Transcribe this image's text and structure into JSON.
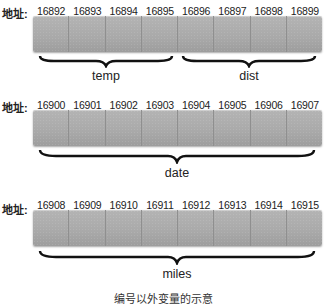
{
  "address_label": "地址:",
  "rows": [
    {
      "addresses": [
        "16892",
        "16893",
        "16894",
        "16895",
        "16896",
        "16897",
        "16898",
        "16899"
      ],
      "variables": [
        {
          "name": "temp",
          "start_cell": 0,
          "end_cell": 3
        },
        {
          "name": "dist",
          "start_cell": 4,
          "end_cell": 7
        }
      ]
    },
    {
      "addresses": [
        "16900",
        "16901",
        "16902",
        "16903",
        "16904",
        "16905",
        "16906",
        "16907"
      ],
      "variables": [
        {
          "name": "date",
          "start_cell": 0,
          "end_cell": 7
        }
      ]
    },
    {
      "addresses": [
        "16908",
        "16909",
        "16910",
        "16911",
        "16912",
        "16913",
        "16914",
        "16915"
      ],
      "variables": [
        {
          "name": "miles",
          "start_cell": 0,
          "end_cell": 7
        }
      ]
    }
  ],
  "caption": "编号以外变量的示意"
}
